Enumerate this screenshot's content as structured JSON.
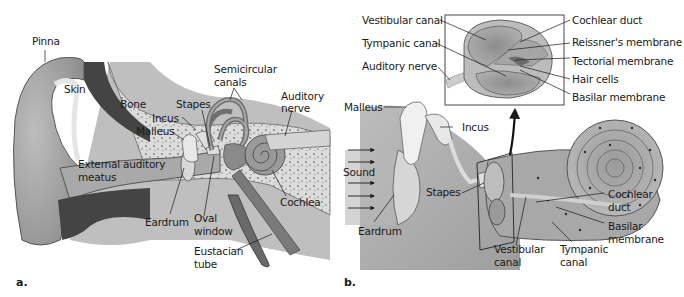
{
  "figure": {
    "panel_a": {
      "letter": "a.",
      "labels": {
        "pinna": "Pinna",
        "skin": "Skin",
        "bone": "Bone",
        "stapes": "Stapes",
        "incus": "Incus",
        "malleus": "Malleus",
        "semicircular_1": "Semicircular",
        "semicircular_2": "canals",
        "auditory_1": "Auditory",
        "auditory_2": "nerve",
        "external_1": "External auditory",
        "external_2": "meatus",
        "cochlea": "Cochlea",
        "eardrum": "Eardrum",
        "oval_1": "Oval",
        "oval_2": "window",
        "eustacian_1": "Eustacian",
        "eustacian_2": "tube"
      }
    },
    "panel_b": {
      "letter": "b.",
      "inset_labels": {
        "vestibular_canal": "Vestibular canal",
        "tympanic_canal": "Tympanic canal",
        "auditory_nerve": "Auditory nerve",
        "cochlear_duct": "Cochlear duct",
        "reissners": "Reissner's membrane",
        "tectorial": "Tectorial membrane",
        "hair_cells": "Hair cells",
        "basilar": "Basilar membrane"
      },
      "labels": {
        "malleus": "Malleus",
        "incus": "Incus",
        "sound": "Sound",
        "stapes": "Stapes",
        "eardrum": "Eardrum",
        "cochlear_1": "Cochlear",
        "cochlear_2": "duct",
        "basilar_1": "Basilar",
        "basilar_2": "membrane",
        "vestibular_1": "Vestibular",
        "vestibular_2": "canal",
        "tympanic_1": "Tympanic",
        "tympanic_2": "canal"
      }
    },
    "colors": {
      "background": "#ffffff",
      "tissue_light": "#c9c9c9",
      "tissue_mid": "#9a9a9a",
      "tissue_dark": "#5a5a5a",
      "bone_fill": "#d8d8d8",
      "text": "#1a1a1a"
    }
  }
}
